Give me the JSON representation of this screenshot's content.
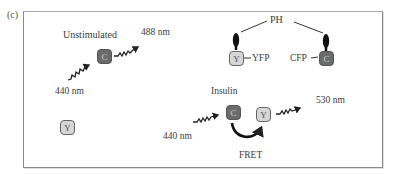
{
  "panel_label": "(c)",
  "unstimulated": {
    "title": "Unstimulated",
    "emission": "488 nm",
    "excitation": "440 nm",
    "cfp_label": "C",
    "yfp_label": "Y"
  },
  "membrane": {
    "ph_label": "PH",
    "yfp_box": "Y",
    "yfp_label": "YFP",
    "cfp_box": "C",
    "cfp_label": "CFP"
  },
  "insulin": {
    "title": "Insulin",
    "excitation": "440 nm",
    "cfp_label": "C",
    "yfp_label": "Y",
    "emission": "530 nm",
    "transfer": "FRET"
  },
  "colors": {
    "cfp_fill": "#6b6b6b",
    "yfp_fill": "#d6d6d6",
    "ph_domain": "#111111",
    "frame": "#8a8a8a"
  }
}
